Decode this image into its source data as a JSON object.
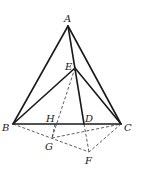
{
  "diagram": {
    "type": "geometry-figure",
    "points": {
      "A": {
        "label": "A",
        "x": 68,
        "y": 26,
        "lx": 64,
        "ly": 22
      },
      "B": {
        "label": "B",
        "x": 13,
        "y": 124,
        "lx": 2,
        "ly": 131
      },
      "C": {
        "label": "C",
        "x": 121,
        "y": 124,
        "lx": 124,
        "ly": 131
      },
      "D": {
        "label": "D",
        "x": 84,
        "y": 124,
        "lx": 85,
        "ly": 122
      },
      "E": {
        "label": "E",
        "x": 75,
        "y": 68,
        "lx": 65,
        "ly": 70
      },
      "F": {
        "label": "F",
        "x": 89,
        "y": 152,
        "lx": 85,
        "ly": 164
      },
      "G": {
        "label": "G",
        "x": 52,
        "y": 138,
        "lx": 45,
        "ly": 150
      },
      "H": {
        "label": "H",
        "x": 55,
        "y": 124,
        "lx": 46,
        "ly": 122
      }
    },
    "solid_segments": [
      [
        "A",
        "B"
      ],
      [
        "A",
        "C"
      ],
      [
        "B",
        "C"
      ],
      [
        "A",
        "D"
      ],
      [
        "B",
        "E"
      ],
      [
        "E",
        "C"
      ]
    ],
    "dashed_segments": [
      [
        "E",
        "G"
      ],
      [
        "B",
        "F"
      ],
      [
        "G",
        "C"
      ],
      [
        "C",
        "F"
      ],
      [
        "D",
        "F"
      ],
      [
        "H",
        "G"
      ]
    ]
  }
}
